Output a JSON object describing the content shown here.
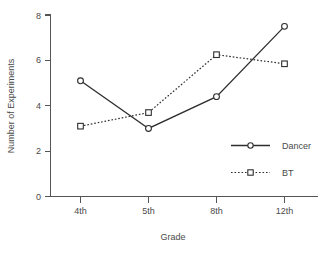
{
  "chart_data": {
    "type": "line",
    "title": "",
    "xlabel": "Grade",
    "ylabel": "Number of Experiments",
    "categories": [
      "4th",
      "5th",
      "8th",
      "12th"
    ],
    "xtick_labels": [
      "4th",
      "5th",
      "8th",
      "12th"
    ],
    "ytick_labels": [
      "0",
      "2",
      "4",
      "6",
      "8"
    ],
    "ytick_values": [
      0,
      2,
      4,
      6,
      8
    ],
    "ylim": [
      0,
      8
    ],
    "grid": false,
    "legend_position": "center-right-inside",
    "series": [
      {
        "name": "Dancer",
        "values": [
          5.1,
          3.0,
          4.4,
          7.5
        ],
        "line_style": "solid",
        "marker": "circle-open",
        "color": "#2e2e2e"
      },
      {
        "name": "BT",
        "values": [
          3.1,
          3.7,
          6.25,
          5.85
        ],
        "line_style": "dotted",
        "marker": "square-open",
        "color": "#2e2e2e"
      }
    ],
    "legend": [
      {
        "label": "Dancer",
        "line_style": "solid",
        "marker": "circle-open"
      },
      {
        "label": "BT",
        "line_style": "dotted",
        "marker": "square-open"
      }
    ]
  }
}
